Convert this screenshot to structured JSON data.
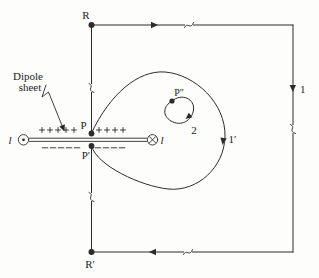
{
  "figure": {
    "title_hint": "Dipole sheet with Amperian loops diagram",
    "colors": {
      "ink": "#2b2b2b",
      "background": "#fdfdfc"
    },
    "labels": {
      "R": "R",
      "R_prime": "R′",
      "P": "P",
      "P_prime": "P′",
      "P_double_prime": "P″",
      "path_1": "1",
      "path_1_prime": "1′",
      "path_2": "2",
      "current_left": "l",
      "current_right": "l",
      "dipole_line1": "Dipole",
      "dipole_line2": "sheet"
    },
    "charges": {
      "plus_left": 5,
      "plus_right": 4,
      "minus_left": 5,
      "minus_right": 4
    },
    "icons": {
      "current_out": "circle-dot-icon (current out of page)",
      "current_in": "circle-cross-icon (current into page)",
      "break": "squiggle-break-icon (line break mark)"
    }
  }
}
